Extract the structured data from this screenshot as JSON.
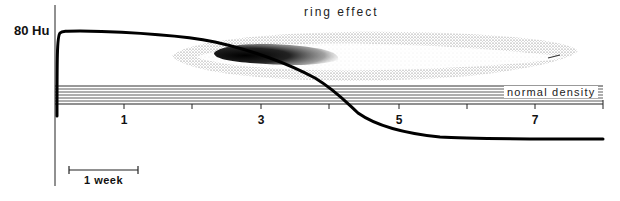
{
  "diagram": {
    "title": "ring effect",
    "y_axis_label": "80 Hu",
    "band_label": "normal density",
    "x_tick_labels": [
      {
        "label": "1",
        "x": 124
      },
      {
        "label": "3",
        "x": 261
      },
      {
        "label": "5",
        "x": 399
      },
      {
        "label": "7",
        "x": 535
      }
    ],
    "scale_bar_label": "1 week",
    "colors": {
      "ink": "#111111",
      "stipple": "#555555",
      "background": "#ffffff"
    }
  }
}
